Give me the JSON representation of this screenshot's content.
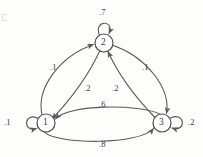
{
  "diagram": {
    "background_color": "#fdfdfc",
    "stroke_color": "#5a5a5a",
    "nodes": [
      {
        "id": "1",
        "label": "1",
        "cx": 46,
        "cy": 123,
        "r": 9
      },
      {
        "id": "2",
        "label": "2",
        "cx": 104,
        "cy": 43,
        "r": 9
      },
      {
        "id": "3",
        "label": "3",
        "cx": 162,
        "cy": 123,
        "r": 9
      }
    ],
    "edges": [
      {
        "id": "e-2-2",
        "from": "2",
        "to": "2",
        "weight": ".7",
        "kind": "self-loop",
        "label_x": 99,
        "label_y": 8
      },
      {
        "id": "e-1-1",
        "from": "1",
        "to": "1",
        "weight": ".1",
        "kind": "self-loop",
        "label_x": 4,
        "label_y": 118
      },
      {
        "id": "e-3-3",
        "from": "3",
        "to": "3",
        "weight": ".2",
        "kind": "self-loop",
        "label_x": 188,
        "label_y": 118
      },
      {
        "id": "e-1-2",
        "from": "1",
        "to": "2",
        "weight": ".1",
        "kind": "curve-outer-left",
        "label_x": 50,
        "label_y": 63
      },
      {
        "id": "e-2-1",
        "from": "2",
        "to": "1",
        "weight": ".2",
        "kind": "curve-inner-left",
        "label_x": 84,
        "label_y": 84
      },
      {
        "id": "e-3-2",
        "from": "3",
        "to": "2",
        "weight": ".2",
        "kind": "curve-inner-right",
        "label_x": 112,
        "label_y": 84
      },
      {
        "id": "e-2-3",
        "from": "2",
        "to": "3",
        "weight": ".1",
        "kind": "curve-outer-right",
        "label_x": 142,
        "label_y": 63
      },
      {
        "id": "e-3-1",
        "from": "3",
        "to": "1",
        "weight": ".6",
        "kind": "arc-upper",
        "label_x": 99,
        "label_y": 100
      },
      {
        "id": "e-1-3",
        "from": "1",
        "to": "3",
        "weight": ".8",
        "kind": "arc-lower",
        "label_x": 99,
        "label_y": 140
      }
    ]
  }
}
